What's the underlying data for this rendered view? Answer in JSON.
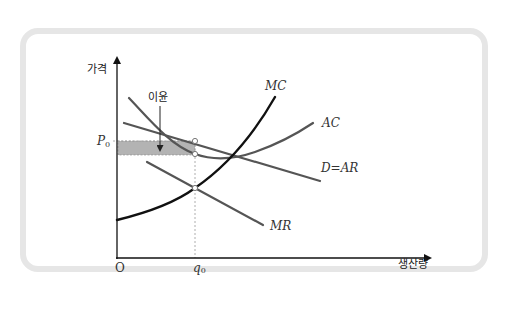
{
  "diagram": {
    "type": "monopoly-profit-maximization",
    "axes": {
      "y_label": "가격",
      "x_label": "생산량",
      "origin_label": "O"
    },
    "ticks": {
      "price_label": "P",
      "price_subscript": "0",
      "quantity_label": "q",
      "quantity_subscript": "0"
    },
    "annotation": {
      "profit_label": "이윤"
    },
    "curves": {
      "mc": {
        "label": "MC",
        "color": "#111111"
      },
      "ac": {
        "label": "AC",
        "color": "#555555"
      },
      "demand": {
        "label": "D=AR",
        "color": "#555555"
      },
      "mr": {
        "label": "MR",
        "color": "#555555"
      }
    },
    "colors": {
      "card_border": "#e6e6e6",
      "profit_fill": "#b3b3b3",
      "axis": "#111111",
      "guide_dashes": "#999999"
    }
  }
}
